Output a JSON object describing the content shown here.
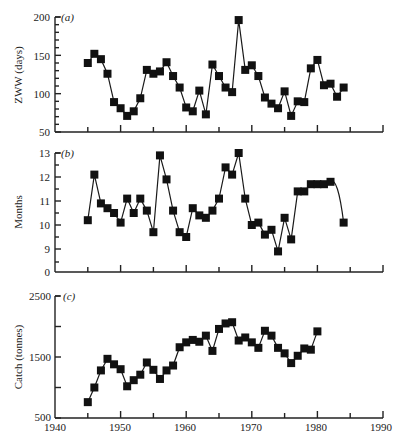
{
  "chart_data": [
    {
      "type": "line",
      "panel": "(a)",
      "title": "",
      "xlabel": "",
      "ylabel": "ZWW (days)",
      "ylim": [
        50,
        200
      ],
      "yticks": [
        50,
        100,
        150,
        200
      ],
      "xlim": [
        1940,
        1990
      ],
      "marker": "square",
      "grid": false,
      "x": [
        1945,
        1946,
        1947,
        1948,
        1949,
        1950,
        1951,
        1952,
        1953,
        1954,
        1955,
        1956,
        1957,
        1958,
        1959,
        1960,
        1961,
        1962,
        1963,
        1964,
        1965,
        1966,
        1967,
        1968,
        1969,
        1970,
        1971,
        1972,
        1973,
        1974,
        1975,
        1976,
        1977,
        1978,
        1979,
        1980,
        1981,
        1982,
        1983,
        1984
      ],
      "values": [
        140,
        152,
        145,
        126,
        89,
        81,
        71,
        77,
        94,
        131,
        126,
        129,
        141,
        123,
        108,
        82,
        77,
        104,
        73,
        138,
        123,
        108,
        102,
        196,
        131,
        137,
        123,
        95,
        87,
        81,
        103,
        71,
        90,
        89,
        133,
        144,
        111,
        113,
        96,
        108,
        75
      ]
    },
    {
      "type": "line",
      "panel": "(b)",
      "title": "",
      "xlabel": "",
      "ylabel": "Months",
      "ylim": [
        9,
        13
      ],
      "axis_break": true,
      "yticks": [
        0,
        9,
        10,
        11,
        12,
        13
      ],
      "xlim": [
        1940,
        1990
      ],
      "marker": "square",
      "grid": false,
      "x": [
        1945,
        1946,
        1947,
        1948,
        1949,
        1950,
        1951,
        1952,
        1953,
        1954,
        1955,
        1956,
        1957,
        1958,
        1959,
        1960,
        1961,
        1962,
        1963,
        1964,
        1965,
        1966,
        1967,
        1968,
        1969,
        1970,
        1971,
        1972,
        1973,
        1974,
        1975,
        1976,
        1977,
        1978,
        1979,
        1980,
        1981,
        1982,
        1984
      ],
      "values": [
        10.2,
        12.1,
        10.9,
        10.7,
        10.5,
        10.1,
        11.1,
        10.5,
        11.1,
        10.6,
        9.7,
        12.9,
        11.9,
        10.6,
        9.7,
        9.5,
        10.7,
        10.4,
        10.3,
        10.6,
        11.1,
        12.4,
        12.1,
        13.0,
        11.1,
        10.0,
        10.1,
        9.6,
        9.8,
        8.9,
        10.3,
        9.4,
        11.4,
        11.4,
        11.7,
        11.7,
        11.7,
        11.8,
        10.1
      ]
    },
    {
      "type": "line",
      "panel": "(c)",
      "title": "",
      "xlabel": "",
      "ylabel": "Catch (tonnes)",
      "ylim": [
        500,
        2500
      ],
      "yticks": [
        500,
        1500,
        2500
      ],
      "xlim": [
        1940,
        1990
      ],
      "xticks": [
        1940,
        1950,
        1960,
        1970,
        1980,
        1990
      ],
      "marker": "square",
      "grid": false,
      "x": [
        1945,
        1946,
        1947,
        1948,
        1949,
        1950,
        1951,
        1952,
        1953,
        1954,
        1955,
        1956,
        1957,
        1958,
        1959,
        1960,
        1961,
        1962,
        1963,
        1964,
        1965,
        1966,
        1967,
        1968,
        1969,
        1970,
        1971,
        1972,
        1973,
        1974,
        1975,
        1976,
        1977,
        1978,
        1979,
        1980
      ],
      "values": [
        760,
        1000,
        1280,
        1470,
        1380,
        1300,
        1020,
        1120,
        1210,
        1410,
        1290,
        1140,
        1280,
        1360,
        1660,
        1740,
        1780,
        1750,
        1850,
        1600,
        1960,
        2050,
        2070,
        1770,
        1820,
        1740,
        1650,
        1930,
        1850,
        1650,
        1560,
        1400,
        1520,
        1640,
        1620,
        1920
      ]
    }
  ],
  "labels": {
    "panel_a": "(a)",
    "panel_b": "(b)",
    "panel_c": "(c)",
    "ylabel_a": "ZWW (days)",
    "ylabel_b": "Months",
    "ylabel_c": "Catch (tonnes)",
    "yticks_a": [
      "200",
      "150",
      "100",
      "50"
    ],
    "yticks_b": [
      "13",
      "12",
      "11",
      "10",
      "9",
      "0"
    ],
    "yticks_c": [
      "2500",
      "1500",
      "500"
    ],
    "xticks": [
      "1940",
      "1950",
      "1960",
      "1970",
      "1980",
      "1990"
    ]
  }
}
